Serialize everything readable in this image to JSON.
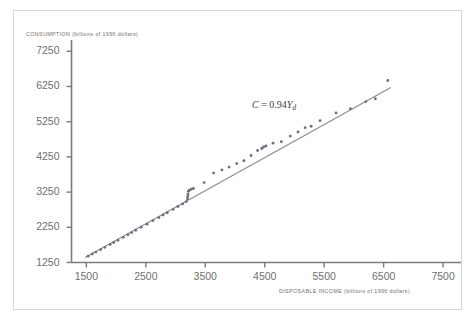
{
  "figure": {
    "border_color": "#d8d6d2",
    "background": "#ffffff"
  },
  "annotation": {
    "symbol_c": "C",
    "equals": " = ",
    "coefficient": "0.94",
    "symbol_y": "Y",
    "subscript": "d",
    "full_text": "C = 0.94Yd"
  },
  "chart_data": {
    "type": "scatter",
    "title": "",
    "xlabel": "DISPOSABLE INCOME (billions of 1996 dollars)",
    "ylabel": "CONSUMPTION (billions of 1996 dollars)",
    "xlim": [
      1250,
      7700
    ],
    "ylim": [
      1250,
      7400
    ],
    "xticks": [
      1500,
      2500,
      3500,
      4500,
      5500,
      6500,
      7500
    ],
    "yticks": [
      1250,
      2250,
      3250,
      4250,
      5250,
      6250,
      7250
    ],
    "grid": false,
    "legend": null,
    "point_color": "#6f6f7e",
    "line_color": "#8a8a96",
    "annotations": [
      {
        "text": "C = 0.94Yd",
        "x": 4450,
        "y": 5650
      }
    ],
    "series": [
      {
        "name": "Consumption vs disposable income",
        "marker": "circle",
        "points": [
          [
            1530,
            1430
          ],
          [
            1600,
            1490
          ],
          [
            1660,
            1545
          ],
          [
            1740,
            1615
          ],
          [
            1810,
            1680
          ],
          [
            1900,
            1760
          ],
          [
            1960,
            1820
          ],
          [
            2030,
            1880
          ],
          [
            2120,
            1965
          ],
          [
            2200,
            2040
          ],
          [
            2260,
            2100
          ],
          [
            2330,
            2165
          ],
          [
            2420,
            2250
          ],
          [
            2520,
            2340
          ],
          [
            2620,
            2440
          ],
          [
            2720,
            2530
          ],
          [
            2790,
            2600
          ],
          [
            2860,
            2665
          ],
          [
            2960,
            2760
          ],
          [
            3040,
            2840
          ],
          [
            3120,
            2915
          ],
          [
            3180,
            2980
          ],
          [
            3200,
            3060
          ],
          [
            3205,
            3120
          ],
          [
            3210,
            3180
          ],
          [
            3215,
            3270
          ],
          [
            3230,
            3300
          ],
          [
            3260,
            3330
          ],
          [
            3300,
            3350
          ],
          [
            3480,
            3520
          ],
          [
            3640,
            3790
          ],
          [
            3780,
            3880
          ],
          [
            3900,
            3960
          ],
          [
            4030,
            4060
          ],
          [
            4150,
            4140
          ],
          [
            4270,
            4290
          ],
          [
            4380,
            4430
          ],
          [
            4450,
            4490
          ],
          [
            4480,
            4530
          ],
          [
            4520,
            4560
          ],
          [
            4640,
            4640
          ],
          [
            4780,
            4680
          ],
          [
            4930,
            4840
          ],
          [
            5060,
            4960
          ],
          [
            5180,
            5080
          ],
          [
            5280,
            5120
          ],
          [
            5430,
            5280
          ],
          [
            5700,
            5500
          ],
          [
            5940,
            5620
          ],
          [
            6200,
            5820
          ],
          [
            6360,
            5900
          ],
          [
            6570,
            6420
          ]
        ]
      }
    ],
    "fit_line": {
      "label": "C = 0.94Yd",
      "slope": 0.94,
      "intercept": 0,
      "x_start": 1480,
      "x_end": 6620
    }
  }
}
